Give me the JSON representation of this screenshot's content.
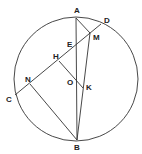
{
  "diagram": {
    "type": "geometry",
    "circle": {
      "cx": 76,
      "cy": 79,
      "r": 62
    },
    "points": {
      "A": {
        "label": "A",
        "x": 76,
        "y": 18,
        "lx": 74,
        "ly": 13
      },
      "B": {
        "label": "B",
        "x": 77,
        "y": 140,
        "lx": 74,
        "ly": 150
      },
      "C": {
        "label": "C",
        "x": 15,
        "y": 95,
        "lx": 6,
        "ly": 102
      },
      "D": {
        "label": "D",
        "x": 101,
        "y": 24,
        "lx": 104,
        "ly": 23
      },
      "E": {
        "label": "E",
        "x": 76,
        "y": 48,
        "lx": 67,
        "ly": 47
      },
      "H": {
        "label": "H",
        "x": 59,
        "y": 61,
        "lx": 53,
        "ly": 59
      },
      "M": {
        "label": "M",
        "x": 90,
        "y": 33,
        "lx": 93,
        "ly": 40
      },
      "N": {
        "label": "N",
        "x": 30,
        "y": 84,
        "lx": 25,
        "ly": 82
      },
      "O": {
        "label": "O",
        "x": 76,
        "y": 78,
        "lx": 67,
        "ly": 85
      },
      "K": {
        "label": "K",
        "x": 83,
        "y": 88,
        "lx": 86,
        "ly": 90
      }
    },
    "segments": [
      [
        "A",
        "B"
      ],
      [
        "C",
        "D"
      ],
      [
        "A",
        "M"
      ],
      [
        "M",
        "B"
      ],
      [
        "H",
        "K"
      ],
      [
        "N",
        "B"
      ]
    ],
    "stroke_color": "#333333"
  }
}
